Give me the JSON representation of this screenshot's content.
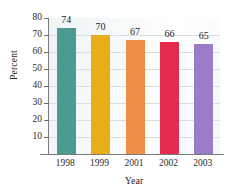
{
  "chart_data": {
    "type": "bar",
    "title": "",
    "subtitle": "",
    "xlabel": "Year",
    "ylabel": "Percent",
    "categories": [
      "1998",
      "1999",
      "2001",
      "2002",
      "2003"
    ],
    "values": [
      74,
      70,
      67,
      66,
      65
    ],
    "value_labels": [
      "74",
      "70",
      "67",
      "66",
      "65"
    ],
    "ylim": [
      0,
      80
    ],
    "ytick_labels": [
      "80",
      "70",
      "60",
      "50",
      "40",
      "30",
      "20",
      "10"
    ],
    "ytick_values": [
      80,
      70,
      60,
      50,
      40,
      30,
      20,
      10
    ],
    "grid": true,
    "grid_axis": "y",
    "legend": false,
    "legend_position": "none",
    "series": [
      {
        "name": "Percent",
        "values": [
          74,
          70,
          67,
          66,
          65
        ]
      }
    ],
    "bar_colors": [
      "#4c9b93",
      "#e8ad17",
      "#ef8e46",
      "#e42b4e",
      "#9a7cc7"
    ],
    "axis_color": "#7a7a7a",
    "grid_color": "#d7dde2",
    "text_color": "#2b2b2b",
    "plot_background": "#f4f8fa",
    "background": "#ffffff"
  }
}
